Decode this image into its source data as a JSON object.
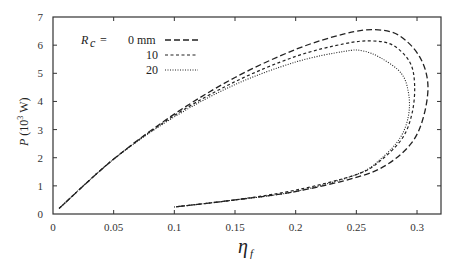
{
  "chart_data": {
    "type": "line",
    "title": "",
    "xlabel": "η_f",
    "ylabel": "P (10^3 W)",
    "xlim": [
      0,
      0.32
    ],
    "ylim": [
      0,
      7
    ],
    "xticks": [
      "0",
      "0.05",
      "0.1",
      "0.15",
      "0.2",
      "0.25",
      "0.3"
    ],
    "yticks": [
      "0",
      "1",
      "2",
      "3",
      "4",
      "5",
      "6",
      "7"
    ],
    "grid": false,
    "legend": {
      "position": "upper-left",
      "title": "R_c =",
      "entries": [
        "0 mm",
        "10",
        "20"
      ]
    },
    "series": [
      {
        "name": "R_c = 0 mm",
        "style": "long-dash",
        "points": [
          [
            0.005,
            0.2
          ],
          [
            0.05,
            1.95
          ],
          [
            0.1,
            3.55
          ],
          [
            0.15,
            4.85
          ],
          [
            0.2,
            5.85
          ],
          [
            0.24,
            6.4
          ],
          [
            0.265,
            6.55
          ],
          [
            0.285,
            6.35
          ],
          [
            0.302,
            5.6
          ],
          [
            0.309,
            4.6
          ],
          [
            0.305,
            3.4
          ],
          [
            0.295,
            2.5
          ],
          [
            0.275,
            1.75
          ],
          [
            0.25,
            1.3
          ],
          [
            0.2,
            0.8
          ],
          [
            0.15,
            0.5
          ],
          [
            0.1,
            0.25
          ]
        ]
      },
      {
        "name": "R_c = 10 mm",
        "style": "short-dash",
        "points": [
          [
            0.005,
            0.2
          ],
          [
            0.05,
            1.95
          ],
          [
            0.1,
            3.5
          ],
          [
            0.15,
            4.7
          ],
          [
            0.2,
            5.6
          ],
          [
            0.24,
            6.05
          ],
          [
            0.262,
            6.15
          ],
          [
            0.28,
            6.0
          ],
          [
            0.294,
            5.4
          ],
          [
            0.298,
            4.6
          ],
          [
            0.296,
            3.6
          ],
          [
            0.288,
            2.7
          ],
          [
            0.27,
            1.9
          ],
          [
            0.25,
            1.4
          ],
          [
            0.2,
            0.85
          ],
          [
            0.15,
            0.5
          ],
          [
            0.1,
            0.25
          ]
        ]
      },
      {
        "name": "R_c = 20 mm",
        "style": "dotted",
        "points": [
          [
            0.005,
            0.2
          ],
          [
            0.05,
            1.95
          ],
          [
            0.1,
            3.45
          ],
          [
            0.15,
            4.6
          ],
          [
            0.2,
            5.4
          ],
          [
            0.24,
            5.78
          ],
          [
            0.255,
            5.8
          ],
          [
            0.27,
            5.55
          ],
          [
            0.287,
            5.0
          ],
          [
            0.293,
            4.3
          ],
          [
            0.293,
            3.5
          ],
          [
            0.286,
            2.7
          ],
          [
            0.27,
            1.95
          ],
          [
            0.25,
            1.4
          ],
          [
            0.2,
            0.8
          ],
          [
            0.15,
            0.5
          ],
          [
            0.1,
            0.25
          ]
        ]
      }
    ]
  },
  "labels": {
    "x_axis": "η",
    "x_axis_sub": "f",
    "y_axis_p": "P",
    "y_axis_unit": "(10",
    "y_axis_exp": "3",
    "y_axis_unit_end": " W)",
    "legend_symbol": "R",
    "legend_sub": "c",
    "legend_eq": "=",
    "legend_0": "0  mm",
    "legend_10": "10",
    "legend_20": "20"
  }
}
